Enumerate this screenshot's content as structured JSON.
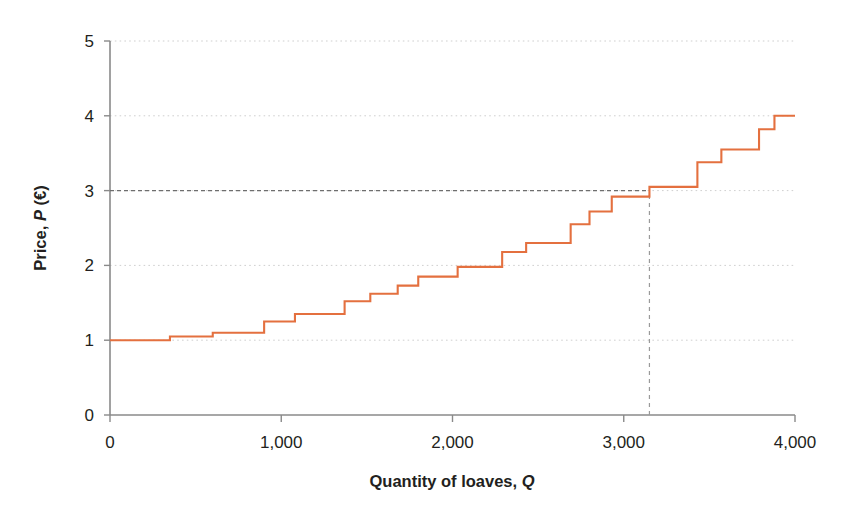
{
  "chart_data": {
    "type": "line",
    "subtype": "step",
    "title": "",
    "xlabel": "Quantity of loaves, Q",
    "ylabel": "Price, P (€)",
    "xlim": [
      0,
      4000
    ],
    "ylim": [
      0,
      5
    ],
    "xticks": [
      0,
      1000,
      2000,
      3000,
      4000
    ],
    "xtick_labels": [
      "0",
      "1,000",
      "2,000",
      "3,000",
      "4,000"
    ],
    "yticks": [
      0,
      1,
      2,
      3,
      4,
      5
    ],
    "ytick_labels": [
      "0",
      "1",
      "2",
      "3",
      "4",
      "5"
    ],
    "grid": "horizontal-dotted",
    "legend": "none",
    "series": [
      {
        "name": "Supply curve (marginal cost)",
        "color": "#e4703f",
        "style": "step-post",
        "points": [
          {
            "q": 0,
            "p": 1.0
          },
          {
            "q": 350,
            "p": 1.0
          },
          {
            "q": 350,
            "p": 1.05
          },
          {
            "q": 600,
            "p": 1.05
          },
          {
            "q": 600,
            "p": 1.1
          },
          {
            "q": 900,
            "p": 1.1
          },
          {
            "q": 900,
            "p": 1.25
          },
          {
            "q": 1080,
            "p": 1.25
          },
          {
            "q": 1080,
            "p": 1.35
          },
          {
            "q": 1370,
            "p": 1.35
          },
          {
            "q": 1370,
            "p": 1.52
          },
          {
            "q": 1520,
            "p": 1.52
          },
          {
            "q": 1520,
            "p": 1.62
          },
          {
            "q": 1680,
            "p": 1.62
          },
          {
            "q": 1680,
            "p": 1.73
          },
          {
            "q": 1800,
            "p": 1.73
          },
          {
            "q": 1800,
            "p": 1.85
          },
          {
            "q": 2030,
            "p": 1.85
          },
          {
            "q": 2030,
            "p": 1.98
          },
          {
            "q": 2290,
            "p": 1.98
          },
          {
            "q": 2290,
            "p": 2.18
          },
          {
            "q": 2430,
            "p": 2.18
          },
          {
            "q": 2430,
            "p": 2.3
          },
          {
            "q": 2690,
            "p": 2.3
          },
          {
            "q": 2690,
            "p": 2.55
          },
          {
            "q": 2800,
            "p": 2.55
          },
          {
            "q": 2800,
            "p": 2.72
          },
          {
            "q": 2930,
            "p": 2.72
          },
          {
            "q": 2930,
            "p": 2.92
          },
          {
            "q": 3150,
            "p": 2.92
          },
          {
            "q": 3150,
            "p": 3.05
          },
          {
            "q": 3430,
            "p": 3.05
          },
          {
            "q": 3430,
            "p": 3.38
          },
          {
            "q": 3570,
            "p": 3.38
          },
          {
            "q": 3570,
            "p": 3.55
          },
          {
            "q": 3790,
            "p": 3.55
          },
          {
            "q": 3790,
            "p": 3.82
          },
          {
            "q": 3880,
            "p": 3.82
          },
          {
            "q": 3880,
            "p": 4.0
          },
          {
            "q": 4000,
            "p": 4.0
          }
        ]
      }
    ],
    "annotations": [
      {
        "name": "price-guide-line",
        "kind": "dashed-horizontal",
        "p": 3,
        "q_from": 0,
        "q_to": 3150,
        "color": "#6e6e6e"
      },
      {
        "name": "quantity-guide-line",
        "kind": "dashed-vertical",
        "q": 3150,
        "p_from": 0,
        "p_to": 3,
        "color": "#9a9a9a"
      }
    ]
  },
  "axes": {
    "x_title": "Quantity of loaves, Q",
    "x_title_plain": "Quantity of loaves,",
    "x_title_italic": "Q",
    "y_title_plain_a": "Price,",
    "y_title_italic": "P",
    "y_title_plain_b": "(€)",
    "y_title": "Price, P (€)"
  },
  "ticks": {
    "x": [
      {
        "value": 0,
        "label": "0"
      },
      {
        "value": 1000,
        "label": "1,000"
      },
      {
        "value": 2000,
        "label": "2,000"
      },
      {
        "value": 3000,
        "label": "3,000"
      },
      {
        "value": 4000,
        "label": "4,000"
      }
    ],
    "y": [
      {
        "value": 0,
        "label": "0"
      },
      {
        "value": 1,
        "label": "1"
      },
      {
        "value": 2,
        "label": "2"
      },
      {
        "value": 3,
        "label": "3"
      },
      {
        "value": 4,
        "label": "4"
      },
      {
        "value": 5,
        "label": "5"
      }
    ]
  },
  "colors": {
    "curve": "#e4703f",
    "axis": "#8a8a8a",
    "grid": "#cfcfcf",
    "guide": "#808080",
    "text": "#231f20",
    "background": "#ffffff"
  }
}
